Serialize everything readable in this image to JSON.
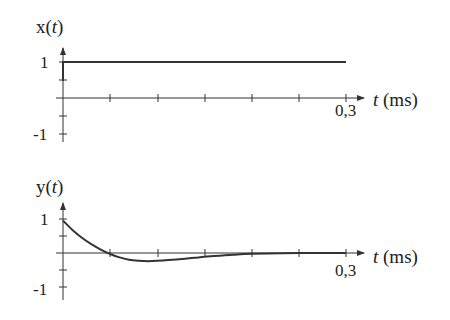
{
  "chart_data": [
    {
      "type": "line",
      "title": "x(t)",
      "ylabel": "x(t)",
      "xlabel": "t (ms)",
      "xlim": [
        0,
        0.3
      ],
      "ylim": [
        -1,
        1
      ],
      "x_ticks": [
        0,
        0.05,
        0.1,
        0.15,
        0.2,
        0.25,
        0.3
      ],
      "x_tick_labels_shown": [
        "0,3"
      ],
      "y_ticks": [
        -1,
        -0.5,
        0.5,
        1
      ],
      "y_tick_labels_shown": [
        "1",
        "-1"
      ],
      "grid": false,
      "series": [
        {
          "name": "x(t)",
          "x": [
            0,
            0,
            0.05,
            0.1,
            0.15,
            0.2,
            0.25,
            0.3
          ],
          "values": [
            0.5,
            1,
            1,
            1,
            1,
            1,
            1,
            1
          ]
        }
      ]
    },
    {
      "type": "line",
      "title": "y(t)",
      "ylabel": "y(t)",
      "xlabel": "t (ms)",
      "xlim": [
        0,
        0.3
      ],
      "ylim": [
        -1,
        1
      ],
      "x_ticks": [
        0,
        0.05,
        0.1,
        0.15,
        0.2,
        0.25,
        0.3
      ],
      "x_tick_labels_shown": [
        "0,3"
      ],
      "y_ticks": [
        -1,
        -0.5,
        0.5,
        1
      ],
      "y_tick_labels_shown": [
        "1",
        "-1"
      ],
      "grid": false,
      "series": [
        {
          "name": "y(t)",
          "x": [
            0,
            0.01,
            0.02,
            0.03,
            0.04,
            0.05,
            0.06,
            0.07,
            0.08,
            0.09,
            0.1,
            0.12,
            0.14,
            0.16,
            0.18,
            0.2,
            0.25,
            0.3
          ],
          "values": [
            0.95,
            0.68,
            0.45,
            0.26,
            0.1,
            -0.03,
            -0.13,
            -0.2,
            -0.23,
            -0.24,
            -0.23,
            -0.19,
            -0.14,
            -0.09,
            -0.05,
            -0.02,
            0.0,
            0.0
          ]
        }
      ]
    }
  ],
  "labels": {
    "top_ylabel": "x(t)",
    "bottom_ylabel": "y(t)",
    "x_axis_label_t": "t",
    "x_axis_label_unit": " (ms)",
    "tick_one": "1",
    "tick_minus_one": "-1",
    "tick_end": "0,3"
  }
}
